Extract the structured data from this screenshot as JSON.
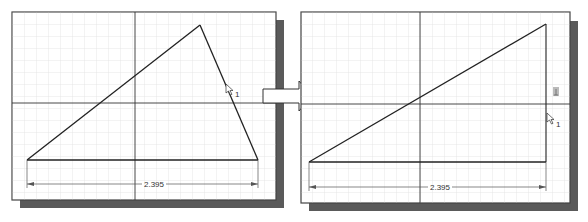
{
  "figure": {
    "colors": {
      "background": "#ffffff",
      "grid_minor": "#e4e4e4",
      "grid_major": "#d0d0d0",
      "axis": "#333333",
      "geometry": "#222222",
      "frame": "#444444",
      "shadow": "#555555",
      "dimension": "#555555"
    }
  },
  "left_panel": {
    "dimension_label": "2.395",
    "cursor_label": "1",
    "icon": "pointer-cursor-icon"
  },
  "right_panel": {
    "dimension_label": "2.395",
    "cursor_label": "1",
    "icon": "pointer-cursor-icon",
    "constraint_icon": "perpendicular-constraint-icon"
  },
  "transition": {
    "icon": "right-arrow-icon"
  }
}
